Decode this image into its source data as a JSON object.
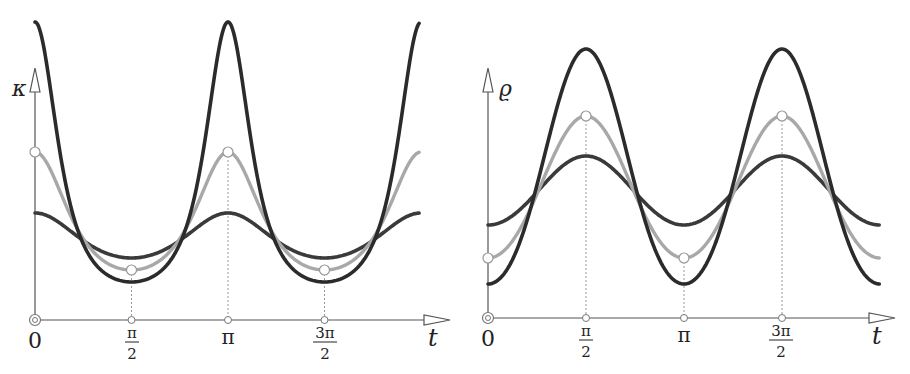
{
  "chart_data": [
    {
      "type": "line",
      "title": "",
      "ylabel": "κ",
      "xlabel": "t",
      "x_ticks": [
        "0",
        "π/2",
        "π",
        "3π/2"
      ],
      "x_range": [
        0,
        6.22
      ],
      "description": "Curvature κ(t) for three ellipses with axis ratios a/b ≈ 2.0, 1.5, 1.2 (b normalized)",
      "series": [
        {
          "name": "high-ratio (dark)",
          "color": "#2b2b2b",
          "ratio": 2.0,
          "values_at_ticks": {
            "0": 7.9,
            "π/2": 1.0,
            "π": 7.9,
            "3π/2": 1.0
          },
          "pixel_max": 298,
          "pixel_min": 38
        },
        {
          "name": "mid-ratio (gray, marked)",
          "color": "#a8a8a8",
          "ratio": 1.5,
          "values_at_ticks": {
            "0": 4.4,
            "π/2": 1.3,
            "π": 4.4,
            "3π/2": 1.3
          },
          "pixel_max": 168,
          "pixel_min": 50
        },
        {
          "name": "low-ratio (dark)",
          "color": "#3a3a3a",
          "ratio": 1.2,
          "values_at_ticks": {
            "0": 2.8,
            "π/2": 1.6,
            "π": 2.8,
            "3π/2": 1.6
          },
          "pixel_max": 107,
          "pixel_min": 62
        }
      ],
      "markers": [
        {
          "t": "0",
          "series": "gray"
        },
        {
          "t": "π/2",
          "series": "gray"
        },
        {
          "t": "π",
          "series": "gray"
        },
        {
          "t": "3π/2",
          "series": "gray"
        }
      ],
      "grid": false,
      "legend": "none"
    },
    {
      "type": "line",
      "title": "",
      "ylabel": "ϱ",
      "xlabel": "t",
      "x_ticks": [
        "0",
        "π/2",
        "π",
        "3π/2"
      ],
      "x_range": [
        0,
        6.22
      ],
      "description": "Radius of curvature ϱ(t) = 1/κ(t) for the same three ellipses",
      "series": [
        {
          "name": "high-ratio (dark)",
          "color": "#2b2b2b",
          "ratio": 2.0,
          "pixel_max": 269,
          "pixel_min": 34
        },
        {
          "name": "mid-ratio (gray, marked)",
          "color": "#a8a8a8",
          "ratio": 1.5,
          "pixel_max": 202,
          "pixel_min": 60
        },
        {
          "name": "low-ratio (dark)",
          "color": "#3a3a3a",
          "ratio": 1.2,
          "pixel_max": 162,
          "pixel_min": 93
        }
      ],
      "markers": [
        {
          "t": "0",
          "series": "gray"
        },
        {
          "t": "π/2",
          "series": "gray"
        },
        {
          "t": "π",
          "series": "gray"
        },
        {
          "t": "3π/2",
          "series": "gray"
        }
      ],
      "grid": false,
      "legend": "none"
    }
  ],
  "left": {
    "ylabel": "κ",
    "xlabel": "t",
    "ticks": [
      {
        "label": "0"
      },
      {
        "num": "π",
        "den": "2"
      },
      {
        "label": "π"
      },
      {
        "num": "3π",
        "den": "2"
      }
    ]
  },
  "right": {
    "ylabel": "ϱ",
    "xlabel": "t",
    "ticks": [
      {
        "label": "0"
      },
      {
        "num": "π",
        "den": "2"
      },
      {
        "label": "π"
      },
      {
        "num": "3π",
        "den": "2"
      }
    ]
  }
}
